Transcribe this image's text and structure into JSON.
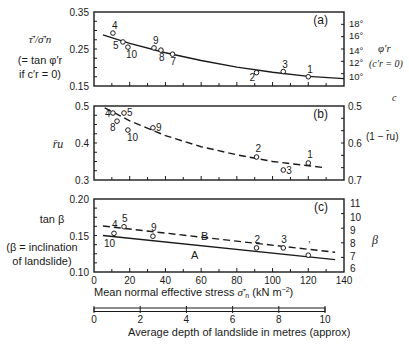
{
  "figure": {
    "x_axis_title": "Mean normal effective stress σ̄′n (kN m⁻²)",
    "x_axis_title_main": "Mean normal effective stress ",
    "x_axis_title_sym": "σ̄′",
    "x_axis_title_sub": "n",
    "x_axis_title_units": " (kN  m",
    "x_axis_title_exp": "−2",
    "x_axis_title_close": ")",
    "x_ticks": [
      "0",
      "20",
      "40",
      "60",
      "80",
      "100",
      "120",
      "140"
    ],
    "depth_axis_title": "Average depth of landslide in metres (approx)",
    "depth_ticks": [
      "0",
      "2",
      "4",
      "6",
      "8",
      "10"
    ],
    "stray_label": "c"
  },
  "panels": {
    "a": {
      "tag": "(a)",
      "left_label_1": "τ̄′/σ̄′n",
      "left_label_2": "(= tan φ′r",
      "left_label_3": "if c′r = 0)",
      "left_ticks": [
        "0.35",
        "0.25",
        "0.15"
      ],
      "right_ticks": [
        "18°",
        "16°",
        "14°",
        "12°",
        "10°"
      ],
      "right_label_1": "φ′r",
      "right_label_2": "(c′r = 0)"
    },
    "b": {
      "tag": "(b)",
      "left_label": "r̄u",
      "left_ticks": [
        "0.5",
        "0.4",
        "0.3"
      ],
      "right_ticks": [
        "0.5",
        "0.6",
        "0.7"
      ],
      "right_label": "(1 − r̄u)"
    },
    "c": {
      "tag": "(c)",
      "left_label_1": "tan β",
      "left_label_2": "(β = inclination",
      "left_label_3": "of landslide)",
      "left_ticks": [
        "0.20",
        "0.15",
        "0.10"
      ],
      "right_ticks": [
        "11",
        "10",
        "9",
        "8",
        "7",
        "6"
      ],
      "right_label": "β",
      "line_a_label": "A",
      "line_b_label": "B"
    }
  },
  "chart_data": [
    {
      "type": "scatter",
      "title": "(a)",
      "xlabel": "Mean normal effective stress σ̄′n (kN m⁻²)",
      "ylabel": "τ̄′/σ̄′n (= tan φ′r if c′r = 0)",
      "ylabel_right": "φ′r (c′r = 0)",
      "xlim": [
        0,
        140
      ],
      "ylim": [
        0.15,
        0.35
      ],
      "points": [
        {
          "label": "4",
          "x": 10.6,
          "y": 0.293
        },
        {
          "label": "5",
          "x": 16.2,
          "y": 0.269
        },
        {
          "label": "10",
          "x": 19,
          "y": 0.255
        },
        {
          "label": "9",
          "x": 33.6,
          "y": 0.253
        },
        {
          "label": "8",
          "x": 37.5,
          "y": 0.247
        },
        {
          "label": "7",
          "x": 44,
          "y": 0.236
        },
        {
          "label": "2",
          "x": 91,
          "y": 0.186
        },
        {
          "label": "3",
          "x": 106,
          "y": 0.189
        },
        {
          "label": "1",
          "x": 120,
          "y": 0.175
        }
      ],
      "trend_line": {
        "style": "solid",
        "x": [
          5,
          20,
          40,
          60,
          80,
          100,
          120,
          140
        ],
        "y": [
          0.288,
          0.265,
          0.24,
          0.219,
          0.201,
          0.187,
          0.176,
          0.17
        ]
      }
    },
    {
      "type": "scatter",
      "title": "(b)",
      "xlabel": "Mean normal effective stress σ̄′n (kN m⁻²)",
      "ylabel": "r̄u",
      "ylabel_right": "(1 − r̄u)",
      "xlim": [
        0,
        140
      ],
      "ylim": [
        0.3,
        0.5
      ],
      "points": [
        {
          "label": "4",
          "x": 10.6,
          "y": 0.481
        },
        {
          "label": "5",
          "x": 16.8,
          "y": 0.481
        },
        {
          "label": "8",
          "x": 12.9,
          "y": 0.459
        },
        {
          "label": "10",
          "x": 19,
          "y": 0.435
        },
        {
          "label": "9",
          "x": 33,
          "y": 0.441
        },
        {
          "label": "2",
          "x": 91,
          "y": 0.362
        },
        {
          "label": "3",
          "x": 106,
          "y": 0.327
        },
        {
          "label": "1",
          "x": 120,
          "y": 0.346
        }
      ],
      "trend_line": {
        "style": "dashed",
        "x": [
          6,
          20,
          40,
          60,
          80,
          100,
          130
        ],
        "y": [
          0.495,
          0.46,
          0.42,
          0.39,
          0.368,
          0.35,
          0.333
        ]
      }
    },
    {
      "type": "scatter",
      "title": "(c)",
      "xlabel": "Mean normal effective stress σ̄′n (kN m⁻²)",
      "ylabel": "tan β (β = inclination of landslide)",
      "ylabel_right": "β",
      "xlim": [
        0,
        140
      ],
      "ylim": [
        0.1,
        0.2
      ],
      "points": [
        {
          "label": "4",
          "x": 11.2,
          "y": 0.153
        },
        {
          "label": "5",
          "x": 16.8,
          "y": 0.162
        },
        {
          "label": "9",
          "x": 33,
          "y": 0.149
        },
        {
          "label": "2",
          "x": 91,
          "y": 0.133
        },
        {
          "label": "3",
          "x": 106,
          "y": 0.133
        },
        {
          "label": "1",
          "x": 120,
          "y": 0.123
        }
      ],
      "lines": [
        {
          "name": "A",
          "style": "solid",
          "x": [
            5,
            135
          ],
          "y": [
            0.15,
            0.117
          ]
        },
        {
          "name": "B",
          "style": "dashed",
          "x": [
            5,
            135
          ],
          "y": [
            0.163,
            0.127
          ]
        }
      ]
    }
  ]
}
